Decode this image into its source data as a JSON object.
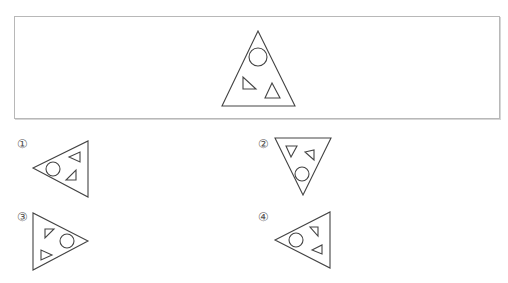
{
  "question_box": {
    "figure": "triangle-with-circle-and-two-small-triangles"
  },
  "options": [
    {
      "label": "①",
      "figure": "triangle-pointing-left"
    },
    {
      "label": "②",
      "figure": "triangle-pointing-down"
    },
    {
      "label": "③",
      "figure": "triangle-pointing-right"
    },
    {
      "label": "④",
      "figure": "triangle-pointing-left"
    }
  ],
  "colors": {
    "stroke": "#444444",
    "box_border": "#b8b8b8"
  }
}
